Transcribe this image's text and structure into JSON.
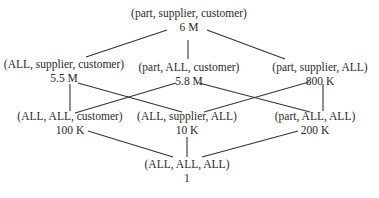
{
  "diagram": {
    "type": "cuboid lattice",
    "nodes": [
      {
        "id": "psc",
        "label": "(part, supplier, customer)",
        "count": "6 M",
        "x": 189,
        "y": 7
      },
      {
        "id": "asc",
        "label": "(ALL, supplier, customer)",
        "count": "5.5 M",
        "x": 63,
        "y": 63
      },
      {
        "id": "pac",
        "label": "(part, ALL, customer)",
        "count": "5.8 M",
        "x": 189,
        "y": 66
      },
      {
        "id": "psa",
        "label": "(part, supplier, ALL)",
        "count": "800 K",
        "x": 315,
        "y": 66
      },
      {
        "id": "aac",
        "label": "(ALL, ALL, customer)",
        "count": "100 K",
        "x": 70,
        "y": 119
      },
      {
        "id": "asa",
        "label": "(ALL, supplier, ALL)",
        "count": "10 K",
        "x": 187,
        "y": 119
      },
      {
        "id": "paa",
        "label": "(part, ALL, ALL)",
        "count": "200 K",
        "x": 315,
        "y": 119
      },
      {
        "id": "aaa",
        "label": "(ALL, ALL, ALL)",
        "count": "1",
        "x": 187,
        "y": 165
      }
    ],
    "edges": [
      {
        "from": "psc",
        "to": "asc",
        "x1": 167,
        "y1": 30,
        "x2": 86,
        "y2": 57
      },
      {
        "from": "psc",
        "to": "pac",
        "x1": 188,
        "y1": 40,
        "x2": 188,
        "y2": 59
      },
      {
        "from": "psc",
        "to": "psa",
        "x1": 207,
        "y1": 30,
        "x2": 285,
        "y2": 59
      },
      {
        "from": "asc",
        "to": "aac",
        "x1": 70,
        "y1": 84,
        "x2": 70,
        "y2": 111
      },
      {
        "from": "asc",
        "to": "asa",
        "x1": 78,
        "y1": 83,
        "x2": 182,
        "y2": 112
      },
      {
        "from": "pac",
        "to": "aac",
        "x1": 176,
        "y1": 83,
        "x2": 75,
        "y2": 113
      },
      {
        "from": "pac",
        "to": "paa",
        "x1": 199,
        "y1": 83,
        "x2": 310,
        "y2": 112
      },
      {
        "from": "psa",
        "to": "asa",
        "x1": 309,
        "y1": 82,
        "x2": 204,
        "y2": 112
      },
      {
        "from": "psa",
        "to": "paa",
        "x1": 323,
        "y1": 84,
        "x2": 323,
        "y2": 111
      },
      {
        "from": "aac",
        "to": "aaa",
        "x1": 88,
        "y1": 131,
        "x2": 173,
        "y2": 157
      },
      {
        "from": "asa",
        "to": "aaa",
        "x1": 187,
        "y1": 137,
        "x2": 187,
        "y2": 157
      },
      {
        "from": "paa",
        "to": "aaa",
        "x1": 298,
        "y1": 131,
        "x2": 202,
        "y2": 157
      }
    ]
  }
}
